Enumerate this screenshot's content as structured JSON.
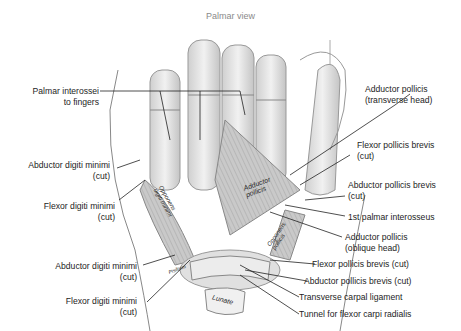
{
  "title": "Palmar view",
  "labels_left": [
    {
      "lines": [
        "Palmar interossei",
        "to fingers"
      ]
    },
    {
      "lines": [
        "Abductor digiti minimi",
        "(cut)"
      ]
    },
    {
      "lines": [
        "Flexor digiti minimi",
        "(cut)"
      ]
    },
    {
      "lines": [
        "Abductor digiti minimi",
        "(cut)"
      ]
    },
    {
      "lines": [
        "Flexor digiti minimi",
        "(cut)"
      ]
    }
  ],
  "labels_right": [
    {
      "lines": [
        "Adductor pollicis",
        "(transverse head)"
      ]
    },
    {
      "lines": [
        "Flexor pollicis brevis",
        "(cut)"
      ]
    },
    {
      "lines": [
        "Abductor pollicis brevis",
        "(cut)"
      ]
    },
    {
      "lines": [
        "1st palmar interosseus"
      ]
    },
    {
      "lines": [
        "Adductor pollicis",
        "(oblique head)"
      ]
    },
    {
      "lines": [
        "Flexor pollicis brevis (cut)"
      ]
    },
    {
      "lines": [
        "Abductor pollicis brevis (cut)"
      ]
    },
    {
      "lines": [
        "Transverse carpal ligament"
      ]
    },
    {
      "lines": [
        "Tunnel for flexor carpi radialis"
      ]
    }
  ],
  "inline_labels": {
    "adductor_pollicis": [
      "Adductor",
      "pollicis"
    ],
    "opponens_digiti_minimi": [
      "Opponens",
      "digiti minimi"
    ],
    "opponens_pollicis": [
      "Opponens",
      "pollicis"
    ],
    "pisiform": "Pisiform",
    "lunate": "Lunate"
  }
}
